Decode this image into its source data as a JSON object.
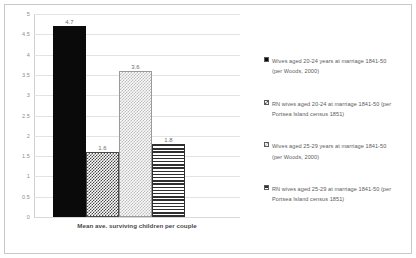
{
  "chart_data": {
    "type": "bar",
    "title": "",
    "xlabel": "Mean ave. surviving children per couple",
    "ylabel": "",
    "categories": [
      "Mean ave. surviving children per couple"
    ],
    "ylim": [
      0,
      5
    ],
    "ytick_step": 0.5,
    "grid": true,
    "legend_position": "right",
    "ytick_labels": [
      "5",
      "4.5",
      "4",
      "3.5",
      "3",
      "2.5",
      "2",
      "1.5",
      "1",
      "0.5",
      "0"
    ],
    "ytick_values": [
      5,
      4.5,
      4,
      3.5,
      3,
      2.5,
      2,
      1.5,
      1,
      0.5,
      0
    ],
    "series": [
      {
        "name": "Wives aged 20-24 years at marriage 1841-50 (per Woods, 2000)",
        "label_line1": "Wives aged 20-24 years at marriage 1841-50",
        "label_line2": "(per Woods, 2000)",
        "value": 4.7,
        "value_label": "4.7",
        "pattern": "solid-black"
      },
      {
        "name": "RN wives aged 20-24 at marriage 1841-50 (per Portsea Island census 1851)",
        "label_line1": "RN wives aged 20-24 at marriage 1841-50 (per",
        "label_line2": "Portsea Island census 1851)",
        "value": 1.6,
        "value_label": "1.6",
        "pattern": "dark-checker"
      },
      {
        "name": "Wives aged 25-29 years at marriage 1841-50 (per Woods, 2000)",
        "label_line1": "Wives aged 25-29 years at marriage 1841-50",
        "label_line2": "(per Woods, 2000)",
        "value": 3.6,
        "value_label": "3.6",
        "pattern": "light-dots"
      },
      {
        "name": "RN wives aged 25-29 at marriage 1841-50 (per Portsea Island census 1851)",
        "label_line1": "RN wives aged 25-29 at marriage 1841-50 (per",
        "label_line2": "Portsea Island census 1851)",
        "value": 1.8,
        "value_label": "1.8",
        "pattern": "h-stripes"
      }
    ],
    "colors": {
      "series1": "#0a0a0a",
      "series2": "#4a4a4a",
      "series3": "#bdbdbd",
      "series4": "#2f2f2f",
      "gridline": "#e3e3e3",
      "axis_text": "#8d8d8d",
      "border": "#c9c9c9"
    }
  }
}
